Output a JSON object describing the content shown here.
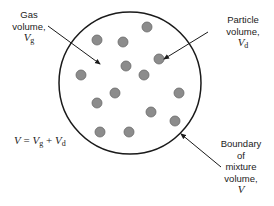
{
  "diagram": {
    "circle": {
      "cx": 130,
      "cy": 83,
      "r": 71,
      "stroke": "#1a1a1a"
    },
    "particle_style": {
      "r": 5,
      "fill": "#8c8c8c",
      "stroke": "#6a6a6a"
    },
    "particles": [
      {
        "x": 147,
        "y": 27
      },
      {
        "x": 97,
        "y": 40
      },
      {
        "x": 123,
        "y": 42
      },
      {
        "x": 159,
        "y": 59
      },
      {
        "x": 126,
        "y": 66
      },
      {
        "x": 81,
        "y": 75
      },
      {
        "x": 144,
        "y": 75
      },
      {
        "x": 115,
        "y": 93
      },
      {
        "x": 179,
        "y": 93
      },
      {
        "x": 97,
        "y": 103
      },
      {
        "x": 151,
        "y": 112
      },
      {
        "x": 175,
        "y": 121
      },
      {
        "x": 100,
        "y": 132
      },
      {
        "x": 129,
        "y": 132
      }
    ],
    "labels": {
      "gas": {
        "line1": "Gas",
        "line2": "volume,",
        "symbol": "V",
        "subscript": "g"
      },
      "particle": {
        "line1": "Particle",
        "line2": "volume,",
        "symbol": "V",
        "subscript": "d"
      },
      "boundary": {
        "line1": "Boundary",
        "line2": "of",
        "line3": "mixture",
        "line4": "volume,",
        "symbol": "V"
      }
    },
    "equation": {
      "lhs": "V",
      "eq": " = ",
      "t1": "V",
      "t1_sub": "g",
      "plus": " + ",
      "t2": "V",
      "t2_sub": "d"
    },
    "arrows": [
      {
        "name": "gas",
        "x1": 48,
        "y1": 26,
        "x2": 100,
        "y2": 64
      },
      {
        "name": "particle",
        "x1": 208,
        "y1": 32,
        "x2": 164,
        "y2": 59
      },
      {
        "name": "boundary",
        "x1": 221,
        "y1": 167,
        "x2": 181,
        "y2": 134
      }
    ]
  }
}
